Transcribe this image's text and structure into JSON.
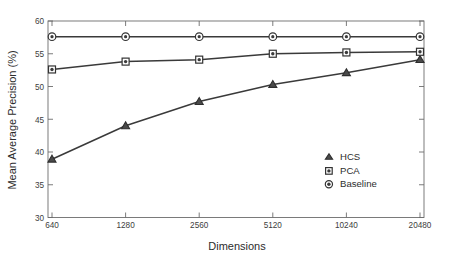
{
  "chart_data": {
    "type": "line",
    "title": "",
    "xlabel": "Dimensions",
    "ylabel": "Mean Average Precision (%)",
    "categories": [
      "640",
      "1280",
      "2560",
      "5120",
      "10240",
      "20480"
    ],
    "x": [
      640,
      1280,
      2560,
      5120,
      10240,
      20480
    ],
    "xscale": "log2-categorical",
    "xtick_labels": [
      "640",
      "1280",
      "2560",
      "5120",
      "10240",
      "20480"
    ],
    "ytick_labels": [
      "30",
      "35",
      "40",
      "45",
      "50",
      "55",
      "60"
    ],
    "yticks": [
      30,
      35,
      40,
      45,
      50,
      55,
      60
    ],
    "ylim": [
      30,
      60
    ],
    "grid": false,
    "legend_position": "center-right",
    "series": [
      {
        "name": "HCS",
        "marker": "triangle",
        "values": [
          38.9,
          44.0,
          47.7,
          50.3,
          52.1,
          54.1
        ]
      },
      {
        "name": "PCA",
        "marker": "square",
        "values": [
          52.6,
          53.8,
          54.1,
          55.0,
          55.2,
          55.3
        ]
      },
      {
        "name": "Baseline",
        "marker": "circle",
        "values": [
          57.6,
          57.6,
          57.6,
          57.6,
          57.6,
          57.6
        ]
      }
    ],
    "colors": {
      "line": "#3a3a3a",
      "axis": "#6d6d6d",
      "text": "#2c2c2c",
      "marker_fill": "#ffffff",
      "background": "#ffffff"
    }
  },
  "legend": {
    "entries": [
      {
        "label": "HCS",
        "icon": "triangle-marker-icon"
      },
      {
        "label": "PCA",
        "icon": "square-marker-icon"
      },
      {
        "label": "Baseline",
        "icon": "circle-marker-icon"
      }
    ]
  },
  "axes": {
    "y_title": "Mean Average Precision (%)",
    "x_title": "Dimensions",
    "y_ticks": [
      "60",
      "55",
      "50",
      "45",
      "40",
      "35",
      "30"
    ],
    "x_ticks": [
      "640",
      "1280",
      "2560",
      "5120",
      "10240",
      "20480"
    ]
  }
}
